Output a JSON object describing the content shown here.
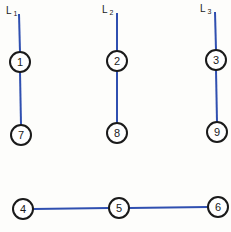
{
  "diagram": {
    "line_color": "#2f4fb0",
    "labels": [
      {
        "id": "L1",
        "main": "L",
        "sub": "1"
      },
      {
        "id": "L2",
        "main": "L",
        "sub": "2"
      },
      {
        "id": "L3",
        "main": "L",
        "sub": "3"
      }
    ],
    "nodes": [
      {
        "id": "1",
        "label": "1"
      },
      {
        "id": "2",
        "label": "2"
      },
      {
        "id": "3",
        "label": "3"
      },
      {
        "id": "4",
        "label": "4"
      },
      {
        "id": "5",
        "label": "5"
      },
      {
        "id": "6",
        "label": "6"
      },
      {
        "id": "7",
        "label": "7"
      },
      {
        "id": "8",
        "label": "8"
      },
      {
        "id": "9",
        "label": "9"
      }
    ],
    "edges": [
      {
        "from": "L1",
        "to": "1"
      },
      {
        "from": "1",
        "to": "7"
      },
      {
        "from": "L2",
        "to": "2"
      },
      {
        "from": "2",
        "to": "8"
      },
      {
        "from": "L3",
        "to": "3"
      },
      {
        "from": "3",
        "to": "9"
      },
      {
        "from": "4",
        "to": "5"
      },
      {
        "from": "5",
        "to": "6"
      }
    ]
  }
}
